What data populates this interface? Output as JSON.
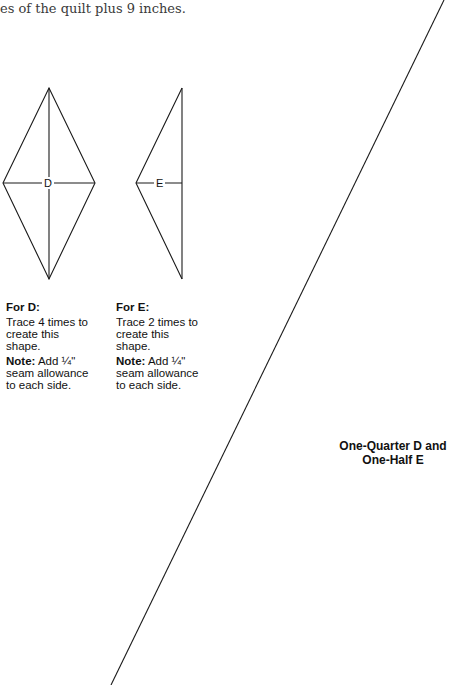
{
  "header": {
    "intro_text": "es of the quilt plus 9 inches."
  },
  "shapes": {
    "d": {
      "label": "D"
    },
    "e": {
      "label": "E"
    }
  },
  "notes": {
    "d": {
      "heading": "For D:",
      "instruction": "Trace 4 times to create this shape.",
      "note_label": "Note:",
      "note_text": " Add ¼\" seam allowance to each side."
    },
    "e": {
      "heading": "For E:",
      "instruction": "Trace 2 times to create this shape.",
      "note_label": "Note:",
      "note_text": " Add ¼\" seam allowance to each side."
    }
  },
  "caption": {
    "line1": "One-Quarter D and",
    "line2": "One-Half E"
  },
  "colors": {
    "line": "#1a1a1a",
    "text": "#111111"
  }
}
